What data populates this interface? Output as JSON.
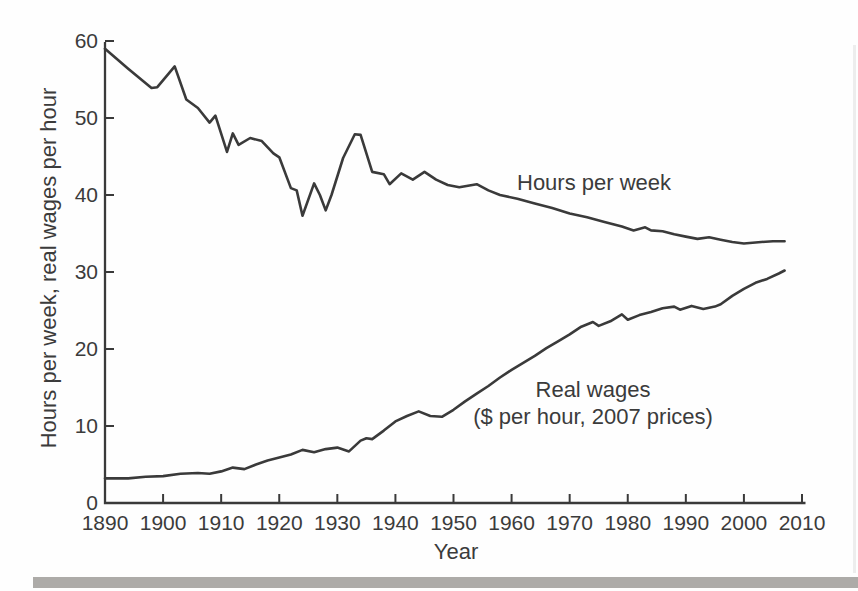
{
  "colors": {
    "line": "#3a3a3a",
    "axis": "#3a3a3a",
    "text": "#3b3b3b",
    "bottom_bar": "#adaba8",
    "page_edge": "#ededed",
    "background": "#fefefe"
  },
  "chart_data": {
    "type": "line",
    "title": "",
    "xlabel": "Year",
    "ylabel": "Hours per week, real wages per hour",
    "xlim": [
      1890,
      2010
    ],
    "ylim": [
      0,
      60
    ],
    "grid": false,
    "legend_position": "inline-annotations",
    "x_ticks": [
      1890,
      1900,
      1910,
      1920,
      1930,
      1940,
      1950,
      1960,
      1970,
      1980,
      1990,
      2000,
      2010
    ],
    "y_ticks": [
      0,
      10,
      20,
      30,
      40,
      50,
      60
    ],
    "annotations": [
      {
        "series": "hours",
        "text": "Hours per week"
      },
      {
        "series": "wages",
        "text": "Real wages"
      },
      {
        "series": "wages",
        "text": "($ per hour, 2007 prices)"
      }
    ],
    "series": [
      {
        "name": "Hours per week",
        "points": [
          [
            1890,
            59.0
          ],
          [
            1894,
            56.4
          ],
          [
            1898,
            53.9
          ],
          [
            1899,
            54.0
          ],
          [
            1902,
            56.7
          ],
          [
            1904,
            52.4
          ],
          [
            1906,
            51.3
          ],
          [
            1908,
            49.4
          ],
          [
            1909,
            50.3
          ],
          [
            1911,
            45.6
          ],
          [
            1912,
            48.0
          ],
          [
            1913,
            46.5
          ],
          [
            1915,
            47.4
          ],
          [
            1917,
            47.0
          ],
          [
            1919,
            45.4
          ],
          [
            1920,
            44.9
          ],
          [
            1922,
            40.9
          ],
          [
            1923,
            40.6
          ],
          [
            1924,
            37.3
          ],
          [
            1926,
            41.5
          ],
          [
            1927,
            40.0
          ],
          [
            1928,
            38.0
          ],
          [
            1929,
            40.0
          ],
          [
            1931,
            44.8
          ],
          [
            1933,
            47.9
          ],
          [
            1934,
            47.8
          ],
          [
            1936,
            43.0
          ],
          [
            1938,
            42.7
          ],
          [
            1939,
            41.4
          ],
          [
            1941,
            42.8
          ],
          [
            1943,
            42.0
          ],
          [
            1945,
            43.0
          ],
          [
            1947,
            42.0
          ],
          [
            1949,
            41.3
          ],
          [
            1951,
            41.0
          ],
          [
            1954,
            41.4
          ],
          [
            1956,
            40.6
          ],
          [
            1958,
            40.0
          ],
          [
            1961,
            39.5
          ],
          [
            1964,
            38.9
          ],
          [
            1967,
            38.3
          ],
          [
            1970,
            37.6
          ],
          [
            1973,
            37.1
          ],
          [
            1976,
            36.5
          ],
          [
            1979,
            35.9
          ],
          [
            1981,
            35.4
          ],
          [
            1983,
            35.8
          ],
          [
            1984,
            35.4
          ],
          [
            1986,
            35.3
          ],
          [
            1988,
            34.9
          ],
          [
            1990,
            34.6
          ],
          [
            1992,
            34.3
          ],
          [
            1994,
            34.5
          ],
          [
            1996,
            34.2
          ],
          [
            1998,
            33.9
          ],
          [
            2000,
            33.7
          ],
          [
            2003,
            33.9
          ],
          [
            2005,
            34.0
          ],
          [
            2007,
            34.0
          ]
        ]
      },
      {
        "name": "Real wages ($ per hour, 2007 prices)",
        "points": [
          [
            1890,
            3.2
          ],
          [
            1894,
            3.2
          ],
          [
            1897,
            3.4
          ],
          [
            1900,
            3.5
          ],
          [
            1903,
            3.8
          ],
          [
            1906,
            3.9
          ],
          [
            1908,
            3.8
          ],
          [
            1910,
            4.1
          ],
          [
            1912,
            4.6
          ],
          [
            1914,
            4.4
          ],
          [
            1916,
            5.0
          ],
          [
            1918,
            5.5
          ],
          [
            1920,
            5.9
          ],
          [
            1922,
            6.3
          ],
          [
            1924,
            6.9
          ],
          [
            1926,
            6.6
          ],
          [
            1928,
            7.0
          ],
          [
            1930,
            7.2
          ],
          [
            1932,
            6.7
          ],
          [
            1934,
            8.1
          ],
          [
            1935,
            8.4
          ],
          [
            1936,
            8.3
          ],
          [
            1938,
            9.4
          ],
          [
            1940,
            10.6
          ],
          [
            1942,
            11.3
          ],
          [
            1944,
            11.9
          ],
          [
            1946,
            11.3
          ],
          [
            1948,
            11.2
          ],
          [
            1950,
            12.1
          ],
          [
            1952,
            13.2
          ],
          [
            1954,
            14.2
          ],
          [
            1956,
            15.2
          ],
          [
            1958,
            16.3
          ],
          [
            1960,
            17.3
          ],
          [
            1962,
            18.2
          ],
          [
            1964,
            19.1
          ],
          [
            1966,
            20.1
          ],
          [
            1968,
            21.0
          ],
          [
            1970,
            21.9
          ],
          [
            1972,
            22.9
          ],
          [
            1974,
            23.5
          ],
          [
            1975,
            23.0
          ],
          [
            1977,
            23.6
          ],
          [
            1979,
            24.5
          ],
          [
            1980,
            23.8
          ],
          [
            1982,
            24.4
          ],
          [
            1984,
            24.8
          ],
          [
            1986,
            25.3
          ],
          [
            1988,
            25.5
          ],
          [
            1989,
            25.1
          ],
          [
            1991,
            25.6
          ],
          [
            1993,
            25.2
          ],
          [
            1995,
            25.5
          ],
          [
            1996,
            25.8
          ],
          [
            1998,
            26.9
          ],
          [
            2000,
            27.8
          ],
          [
            2002,
            28.6
          ],
          [
            2004,
            29.1
          ],
          [
            2006,
            29.8
          ],
          [
            2007,
            30.2
          ]
        ]
      }
    ]
  }
}
